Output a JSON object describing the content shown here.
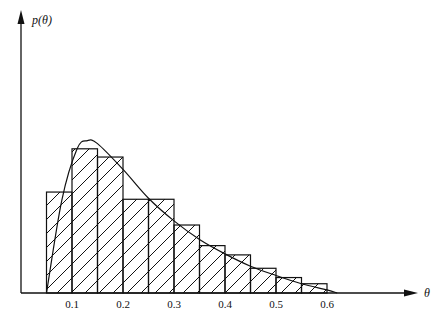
{
  "chart_data": {
    "type": "bar",
    "subtype": "histogram with overlaid density curve",
    "title": "",
    "xlabel": "θ",
    "ylabel": "p(θ)",
    "xticks": [
      "0.1",
      "0.2",
      "0.3",
      "0.4",
      "0.5",
      "0.6"
    ],
    "xlim": [
      0,
      0.67
    ],
    "grid": false,
    "legend": null,
    "bin_width": 0.05,
    "bins": [
      {
        "from": 0.05,
        "to": 0.1,
        "height": 0.98
      },
      {
        "from": 0.1,
        "to": 0.15,
        "height": 1.4
      },
      {
        "from": 0.15,
        "to": 0.2,
        "height": 1.32
      },
      {
        "from": 0.2,
        "to": 0.25,
        "height": 0.91
      },
      {
        "from": 0.25,
        "to": 0.3,
        "height": 0.91
      },
      {
        "from": 0.3,
        "to": 0.35,
        "height": 0.66
      },
      {
        "from": 0.35,
        "to": 0.4,
        "height": 0.46
      },
      {
        "from": 0.4,
        "to": 0.45,
        "height": 0.37
      },
      {
        "from": 0.45,
        "to": 0.5,
        "height": 0.24
      },
      {
        "from": 0.5,
        "to": 0.55,
        "height": 0.15
      },
      {
        "from": 0.55,
        "to": 0.6,
        "height": 0.09
      }
    ],
    "curve": {
      "description": "smooth right-skewed density, starting near 0.05, peak near 0.13, tailing to ~0.62",
      "x": [
        0.05,
        0.08,
        0.11,
        0.13,
        0.15,
        0.2,
        0.25,
        0.3,
        0.35,
        0.4,
        0.45,
        0.5,
        0.55,
        0.6,
        0.62
      ],
      "y": [
        0.0,
        0.9,
        1.4,
        1.48,
        1.45,
        1.2,
        0.92,
        0.7,
        0.52,
        0.38,
        0.26,
        0.17,
        0.09,
        0.03,
        0.0
      ]
    },
    "fill": "diagonal hatch"
  },
  "axes": {
    "x_label": "θ",
    "y_label": "p(θ)",
    "tick_labels": [
      "0.1",
      "0.2",
      "0.3",
      "0.4",
      "0.5",
      "0.6"
    ]
  }
}
